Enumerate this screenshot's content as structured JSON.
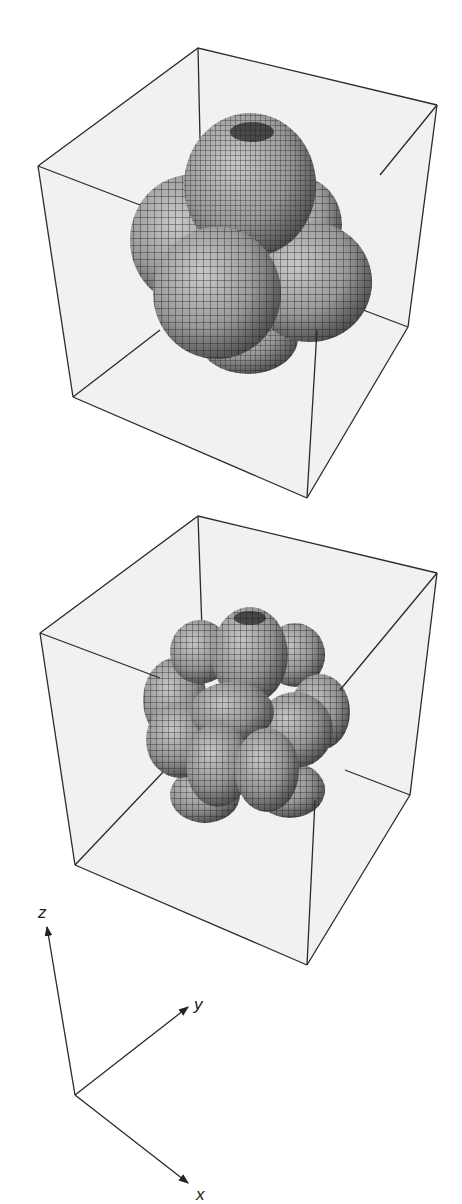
{
  "figure": {
    "panels": [
      {
        "name": "top-plot",
        "description": "3D surface plot inside bounding box: central sphere with four surrounding lobes",
        "lobes": 5
      },
      {
        "name": "bottom-plot",
        "description": "3D surface plot inside bounding box: central elongated lobe with many surrounding lobes",
        "lobes": 13
      }
    ],
    "axes": {
      "z_label": "z",
      "y_label": "y",
      "x_label": "x"
    }
  },
  "colors": {
    "box_fill": "#f2f2f2",
    "edge": "#2a2a2a",
    "surface_light": "#b8b8b8",
    "surface_dark": "#3a3a3a"
  }
}
